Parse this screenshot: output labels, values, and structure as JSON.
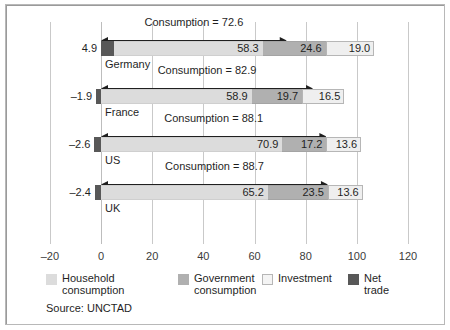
{
  "chart_data": {
    "type": "bar",
    "orientation": "horizontal",
    "stacked": true,
    "title": "",
    "xlabel": "",
    "ylabel": "",
    "xlim": [
      -20,
      120
    ],
    "xticks": [
      -20,
      0,
      20,
      40,
      60,
      80,
      100,
      120
    ],
    "xtick_labels": [
      "–20",
      "0",
      "20",
      "40",
      "60",
      "80",
      "100",
      "120"
    ],
    "grid": true,
    "legend_position": "bottom",
    "categories": [
      "Germany",
      "France",
      "US",
      "UK"
    ],
    "series": [
      {
        "name": "Household consumption",
        "key": "household",
        "color": "#dcdcdc",
        "values": [
          58.3,
          58.9,
          70.9,
          65.2
        ]
      },
      {
        "name": "Government consumption",
        "key": "government",
        "color": "#b0b0b0",
        "values": [
          24.6,
          19.7,
          17.2,
          23.5
        ]
      },
      {
        "name": "Investment",
        "key": "investment",
        "color": "#efefef",
        "values": [
          19.0,
          16.5,
          13.6,
          13.6
        ]
      },
      {
        "name": "Net trade",
        "key": "nettrade",
        "color": "#585858",
        "values": [
          4.9,
          -1.9,
          -2.6,
          -2.4
        ]
      }
    ],
    "annotations": [
      {
        "category": "Germany",
        "label": "Consumption = 72.6",
        "value": 72.6
      },
      {
        "category": "France",
        "label": "Consumption = 82.9",
        "value": 82.9
      },
      {
        "category": "US",
        "label": "Consumption = 88.1",
        "value": 88.1
      },
      {
        "category": "UK",
        "label": "Consumption = 88.7",
        "value": 88.7
      }
    ],
    "net_trade_labels": [
      "4.9",
      "–1.9",
      "–2.6",
      "–2.4"
    ],
    "source": "Source: UNCTAD"
  },
  "rows": [
    {
      "country": "Germany",
      "net_label": "4.9",
      "consumption_label": "Consumption = 72.6",
      "values": {
        "household": "58.3",
        "government": "24.6",
        "investment": "19.0"
      }
    },
    {
      "country": "France",
      "net_label": "–1.9",
      "consumption_label": "Consumption = 82.9",
      "values": {
        "household": "58.9",
        "government": "19.7",
        "investment": "16.5"
      }
    },
    {
      "country": "US",
      "net_label": "–2.6",
      "consumption_label": "Consumption = 88.1",
      "values": {
        "household": "70.9",
        "government": "17.2",
        "investment": "13.6"
      }
    },
    {
      "country": "UK",
      "net_label": "–2.4",
      "consumption_label": "Consumption = 88.7",
      "values": {
        "household": "65.2",
        "government": "23.5",
        "investment": "13.6"
      }
    }
  ],
  "axis": {
    "ticks": [
      "–20",
      "0",
      "20",
      "40",
      "60",
      "80",
      "100",
      "120"
    ]
  },
  "legend": {
    "items": [
      {
        "label": "Household\nconsumption",
        "key": "household"
      },
      {
        "label": "Government\nconsumption",
        "key": "government"
      },
      {
        "label": "Investment",
        "key": "investment"
      },
      {
        "label": "Net trade",
        "key": "nettrade"
      }
    ]
  },
  "source": {
    "text": "Source: UNCTAD"
  },
  "colors": {
    "household": "#dcdcdc",
    "government": "#b0b0b0",
    "investment": "#efefef",
    "nettrade": "#585858",
    "grid": "#c9c9c9",
    "text": "#1f1f1f",
    "frame": "#b8b8b8"
  }
}
